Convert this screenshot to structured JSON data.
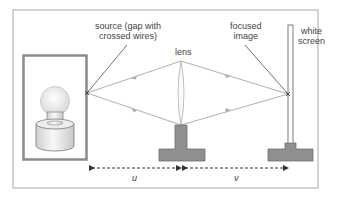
{
  "diagram": {
    "labels": {
      "source": [
        "source (gap with",
        "crossed wires)"
      ],
      "lens": "lens",
      "focused_image": [
        "focused",
        "image"
      ],
      "white_screen": [
        "white",
        "screen"
      ],
      "u": "u",
      "v": "v"
    },
    "colors": {
      "frame": "#9a9a9a",
      "rays": "#b0b0b0",
      "holder": "#8c8c8c",
      "text": "#444444"
    }
  }
}
